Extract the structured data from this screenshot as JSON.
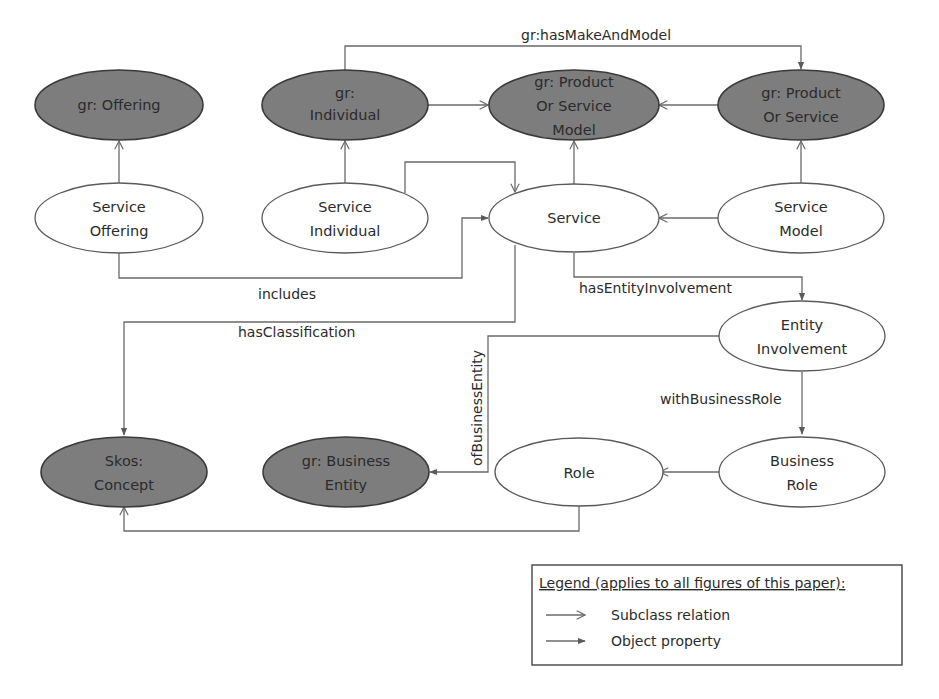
{
  "figure": {
    "nodes": [
      {
        "id": "gr_offering",
        "lines": [
          "gr: Offering"
        ],
        "style": "dark"
      },
      {
        "id": "gr_individual",
        "lines": [
          "gr:",
          "Individual"
        ],
        "style": "dark"
      },
      {
        "id": "gr_posm",
        "lines": [
          "gr: Product",
          "Or Service",
          "Model"
        ],
        "style": "dark"
      },
      {
        "id": "gr_pos",
        "lines": [
          "gr: Product",
          "Or Service"
        ],
        "style": "dark"
      },
      {
        "id": "service_offering",
        "lines": [
          "Service",
          "Offering"
        ],
        "style": "light"
      },
      {
        "id": "service_individual",
        "lines": [
          "Service",
          "Individual"
        ],
        "style": "light"
      },
      {
        "id": "service",
        "lines": [
          "Service"
        ],
        "style": "light"
      },
      {
        "id": "service_model",
        "lines": [
          "Service",
          "Model"
        ],
        "style": "light"
      },
      {
        "id": "entity_involvement",
        "lines": [
          "Entity",
          "Involvement"
        ],
        "style": "light"
      },
      {
        "id": "skos_concept",
        "lines": [
          "Skos:",
          "Concept"
        ],
        "style": "dark"
      },
      {
        "id": "gr_business_entity",
        "lines": [
          "gr: Business",
          "Entity"
        ],
        "style": "dark"
      },
      {
        "id": "role",
        "lines": [
          "Role"
        ],
        "style": "light"
      },
      {
        "id": "business_role",
        "lines": [
          "Business",
          "Role"
        ],
        "style": "light"
      }
    ],
    "edge_labels": {
      "has_make_and_model": "gr:hasMakeAndModel",
      "includes": "includes",
      "has_classification": "hasClassification",
      "has_entity_involvement": "hasEntityInvolvement",
      "of_business_entity": "ofBusinessEntity",
      "with_business_role": "withBusinessRole"
    },
    "edges": [
      {
        "from": "service_offering",
        "to": "gr_offering",
        "type": "subclass"
      },
      {
        "from": "service_individual",
        "to": "gr_individual",
        "type": "subclass"
      },
      {
        "from": "gr_individual",
        "to": "gr_posm",
        "type": "subclass"
      },
      {
        "from": "gr_pos",
        "to": "gr_posm",
        "type": "subclass"
      },
      {
        "from": "service",
        "to": "gr_posm",
        "type": "subclass"
      },
      {
        "from": "service_model",
        "to": "gr_pos",
        "type": "subclass"
      },
      {
        "from": "service_model",
        "to": "service",
        "type": "subclass"
      },
      {
        "from": "service_individual",
        "to": "service",
        "type": "subclass"
      },
      {
        "from": "gr_individual",
        "to": "gr_pos",
        "type": "object",
        "label": "gr:hasMakeAndModel"
      },
      {
        "from": "service_offering",
        "to": "service",
        "type": "object",
        "label": "includes"
      },
      {
        "from": "service",
        "to": "skos_concept",
        "type": "object",
        "label": "hasClassification"
      },
      {
        "from": "service",
        "to": "entity_involvement",
        "type": "object",
        "label": "hasEntityInvolvement"
      },
      {
        "from": "entity_involvement",
        "to": "gr_business_entity",
        "type": "object",
        "label": "ofBusinessEntity"
      },
      {
        "from": "entity_involvement",
        "to": "business_role",
        "type": "object",
        "label": "withBusinessRole"
      },
      {
        "from": "business_role",
        "to": "role",
        "type": "subclass"
      },
      {
        "from": "role",
        "to": "skos_concept",
        "type": "subclass"
      }
    ],
    "legend": {
      "title": "Legend (applies to all figures of this paper):",
      "items": [
        {
          "arrow": "open-arrow",
          "label": "Subclass relation"
        },
        {
          "arrow": "filled-arrow",
          "label": "Object property"
        }
      ]
    },
    "colors": {
      "dark_fill": "#7d7d7d",
      "light_fill": "#ffffff",
      "line": "#6a6a6a",
      "text": "#2b2b2b"
    }
  }
}
